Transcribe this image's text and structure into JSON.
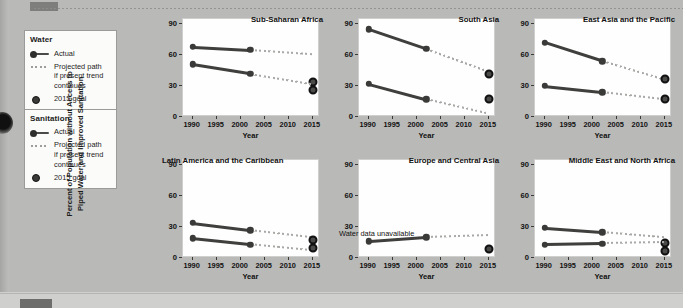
{
  "figure": {
    "ylabel_line1": "Percent of Population without Access to",
    "ylabel_line2": "Piped Water and Improved Sanitation",
    "xlabel": "Year",
    "yticks": [
      "0",
      "30",
      "60",
      "90"
    ],
    "xticks": [
      "1990",
      "1995",
      "2000",
      "2005",
      "2010",
      "2015"
    ]
  },
  "legend": {
    "water": {
      "title": "Water",
      "actual": "Actual",
      "projected_l1": "Projected path",
      "projected_l2": "if present trend",
      "projected_l3": "continues",
      "goal": "2015 goal"
    },
    "sanitation": {
      "title": "Sanitation",
      "actual": "Actual",
      "projected_l1": "Projected path",
      "projected_l2": "if present trend",
      "projected_l3": "continues",
      "goal": "2015 goal"
    }
  },
  "chart_data": {
    "type": "line",
    "title": "",
    "xlabel": "Year",
    "ylabel": "Percent of Population without Access to Piped Water and Improved Sanitation",
    "xlim": [
      1988,
      2016.5
    ],
    "ylim": [
      0,
      95
    ],
    "yticks": [
      0,
      30,
      60,
      90
    ],
    "xticks": [
      1990,
      1995,
      2000,
      2005,
      2010,
      2015
    ],
    "grid": false,
    "legend_position": "outside-left",
    "series_names": [
      "Sanitation actual",
      "Sanitation projected",
      "Sanitation 2015 goal",
      "Water actual",
      "Water projected",
      "Water 2015 goal"
    ],
    "panels": [
      {
        "name": "Sub-Saharan Africa",
        "title_align": "right",
        "note": "",
        "sanitation": {
          "actual_x": [
            1990,
            2002
          ],
          "actual_y": [
            68,
            65
          ],
          "projected_x": [
            2002,
            2015
          ],
          "projected_y": [
            65,
            61
          ],
          "goal_x": 2015,
          "goal_y": 34
        },
        "water": {
          "actual_x": [
            1990,
            2002
          ],
          "actual_y": [
            51,
            42
          ],
          "projected_x": [
            2002,
            2015
          ],
          "projected_y": [
            42,
            32
          ],
          "goal_x": 2015,
          "goal_y": 26
        }
      },
      {
        "name": "South Asia",
        "title_align": "right",
        "note": "",
        "sanitation": {
          "actual_x": [
            1990,
            2002
          ],
          "actual_y": [
            85,
            66
          ],
          "projected_x": [
            2002,
            2015
          ],
          "projected_y": [
            66,
            44
          ],
          "goal_x": 2015,
          "goal_y": 42
        },
        "water": {
          "actual_x": [
            1990,
            2002
          ],
          "actual_y": [
            32,
            17
          ],
          "projected_x": [
            2002,
            2015
          ],
          "projected_y": [
            17,
            3
          ],
          "goal_x": 2015,
          "goal_y": 17
        }
      },
      {
        "name": "East Asia and the Pacific",
        "title_align": "right",
        "note": "",
        "sanitation": {
          "actual_x": [
            1990,
            2002
          ],
          "actual_y": [
            72,
            54
          ],
          "projected_x": [
            2002,
            2015
          ],
          "projected_y": [
            54,
            36
          ],
          "goal_x": 2015,
          "goal_y": 37
        },
        "water": {
          "actual_x": [
            1990,
            2002
          ],
          "actual_y": [
            30,
            24
          ],
          "projected_x": [
            2002,
            2015
          ],
          "projected_y": [
            24,
            17
          ],
          "goal_x": 2015,
          "goal_y": 17
        }
      },
      {
        "name": "Latin America and the Caribbean",
        "title_align": "left",
        "note": "",
        "sanitation": {
          "actual_x": [
            1990,
            2002
          ],
          "actual_y": [
            34,
            27
          ],
          "projected_x": [
            2002,
            2015
          ],
          "projected_y": [
            27,
            20
          ],
          "goal_x": 2015,
          "goal_y": 17
        },
        "water": {
          "actual_x": [
            1990,
            2002
          ],
          "actual_y": [
            19,
            13
          ],
          "projected_x": [
            2002,
            2015
          ],
          "projected_y": [
            13,
            7
          ],
          "goal_x": 2015,
          "goal_y": 10
        }
      },
      {
        "name": "Europe and Central Asia",
        "title_align": "right",
        "note": "Water data unavailable",
        "sanitation": {
          "actual_x": [
            1990,
            2002
          ],
          "actual_y": [
            16,
            20
          ],
          "projected_x": [
            2002,
            2015
          ],
          "projected_y": [
            20,
            22
          ],
          "goal_x": 2015,
          "goal_y": 9
        },
        "water": null
      },
      {
        "name": "Middle East and North Africa",
        "title_align": "right",
        "note": "",
        "sanitation": {
          "actual_x": [
            1990,
            2002
          ],
          "actual_y": [
            29,
            25
          ],
          "projected_x": [
            2002,
            2015
          ],
          "projected_y": [
            25,
            20
          ],
          "goal_x": 2015,
          "goal_y": 15
        },
        "water": {
          "actual_x": [
            1990,
            2002
          ],
          "actual_y": [
            13,
            14
          ],
          "projected_x": [
            2002,
            2015
          ],
          "projected_y": [
            14,
            15
          ],
          "goal_x": 2015,
          "goal_y": 7
        }
      }
    ]
  }
}
